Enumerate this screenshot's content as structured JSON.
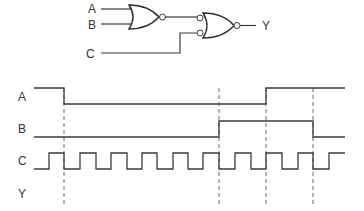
{
  "circuit": {
    "inputs": [
      {
        "label": "A"
      },
      {
        "label": "B"
      },
      {
        "label": "C"
      }
    ],
    "output": {
      "label": "Y"
    },
    "gates": [
      {
        "type": "NOR",
        "inputs": [
          "A",
          "B"
        ],
        "output_bubble": true
      },
      {
        "type": "NOR",
        "inputs": [
          "NOR(A,B)",
          "C"
        ],
        "inverted_inputs": true,
        "output_bubble": true
      }
    ]
  },
  "timing": {
    "signals": [
      {
        "label": "A",
        "description": "high, falls at t1, rises at t3"
      },
      {
        "label": "B",
        "description": "low, rises at t2, falls at t4"
      },
      {
        "label": "C",
        "description": "clock square wave, 10 rising edges"
      },
      {
        "label": "Y",
        "description": "to be determined (blank)"
      }
    ],
    "markers": [
      "t1",
      "t2",
      "t3",
      "t4"
    ]
  },
  "colors": {
    "line": "#3a3a3a",
    "background": "#ffffff"
  }
}
